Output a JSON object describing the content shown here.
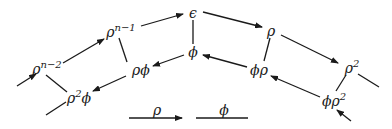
{
  "diagram": {
    "colors": {
      "ink": "#1a1a1a",
      "background": "#ffffff"
    },
    "nodes": [
      {
        "id": "rho_n2",
        "base": "ρ",
        "exp": "n−2",
        "x": 47,
        "y": 68
      },
      {
        "id": "rho_n1",
        "base": "ρ",
        "exp": "n−1",
        "x": 121,
        "y": 31
      },
      {
        "id": "eps",
        "base": "ϵ",
        "exp": "",
        "x": 193,
        "y": 13
      },
      {
        "id": "rho",
        "base": "ρ",
        "exp": "",
        "x": 271,
        "y": 31
      },
      {
        "id": "rho2",
        "base": "ρ",
        "exp": "2",
        "x": 352,
        "y": 67
      },
      {
        "id": "rho2phi",
        "base": "ρ",
        "exp": "2",
        "suffix": "ϕ",
        "x": 79,
        "y": 97
      },
      {
        "id": "rhophi",
        "base": "ρϕ",
        "exp": "",
        "x": 141,
        "y": 70
      },
      {
        "id": "phi",
        "base": "ϕ",
        "exp": "",
        "x": 193,
        "y": 52
      },
      {
        "id": "phirho",
        "base": "ϕρ",
        "exp": "",
        "x": 259,
        "y": 70
      },
      {
        "id": "phirho2",
        "base": "ϕρ",
        "exp": "2",
        "x": 334,
        "y": 100
      }
    ],
    "rho_edges": [
      {
        "from": "rho_n2",
        "to": "rho_n1"
      },
      {
        "from": "rho_n1",
        "to": "eps"
      },
      {
        "from": "eps",
        "to": "rho"
      },
      {
        "from": "rho",
        "to": "rho2"
      },
      {
        "from": "phi",
        "to": "rhophi"
      },
      {
        "from": "rhophi",
        "to": "rho2phi"
      },
      {
        "from": "phirho",
        "to": "phi"
      },
      {
        "from": "phirho2",
        "to": "phirho"
      }
    ],
    "phi_edges": [
      {
        "from": "rho_n2",
        "to": "rho2phi"
      },
      {
        "from": "rho_n1",
        "to": "rhophi"
      },
      {
        "from": "eps",
        "to": "phi"
      },
      {
        "from": "rho",
        "to": "phirho"
      },
      {
        "from": "rho2",
        "to": "phirho2"
      }
    ],
    "dangling": [
      {
        "type": "arrow-in",
        "label": "incoming ρ to ρ^{n−2}"
      },
      {
        "type": "line-out",
        "label": "outgoing from ρ²ϕ"
      },
      {
        "type": "line-out",
        "label": "outgoing from ρ²"
      },
      {
        "type": "arrow-in",
        "label": "incoming ρ to ϕρ²"
      }
    ],
    "legend": {
      "rho_label": "ρ",
      "phi_label": "ϕ"
    }
  }
}
